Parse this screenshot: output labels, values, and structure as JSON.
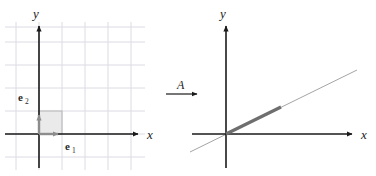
{
  "figure": {
    "background": "#ffffff",
    "width": 376,
    "height": 176
  },
  "colors": {
    "axis": "#1a1a1a",
    "grid": "#dcdce4",
    "vector": "#8c8c8c",
    "square_fill": "#e3e3e3",
    "square_stroke": "#b0b0b0",
    "thick_segment": "#6e6e6e",
    "thin_line": "#9a9a9a",
    "text": "#1a1a1a"
  },
  "left_panel": {
    "name": "domain-plane",
    "axes": {
      "x_label": "x",
      "y_label": "y"
    },
    "grid": {
      "visible": true,
      "spacing": 23
    },
    "origin": {
      "x": 39,
      "y": 134
    },
    "basis_vectors": [
      {
        "name": "e1",
        "label_base": "e",
        "label_sub": "1",
        "from": [
          0,
          0
        ],
        "to": [
          1,
          0
        ]
      },
      {
        "name": "e2",
        "label_base": "e",
        "label_sub": "2",
        "from": [
          0,
          0
        ],
        "to": [
          0,
          1
        ]
      }
    ],
    "unit_square": {
      "corners": [
        [
          0,
          0
        ],
        [
          1,
          0
        ],
        [
          1,
          1
        ],
        [
          0,
          1
        ]
      ],
      "filled": true
    }
  },
  "map_arrow": {
    "name": "transformation-arrow",
    "label": "A"
  },
  "right_panel": {
    "name": "codomain-plane",
    "axes": {
      "x_label": "x",
      "y_label": "y"
    },
    "grid": {
      "visible": false
    },
    "origin": {
      "x": 226,
      "y": 134
    },
    "image_segment": {
      "name": "collapsed-unit-square",
      "description": "image of the unit square collapsed onto a line through the origin",
      "from": [
        0,
        0
      ],
      "to": [
        55,
        27
      ]
    },
    "image_line": {
      "name": "image-line",
      "description": "line through origin spanning the column space",
      "slope": 0.49
    }
  }
}
